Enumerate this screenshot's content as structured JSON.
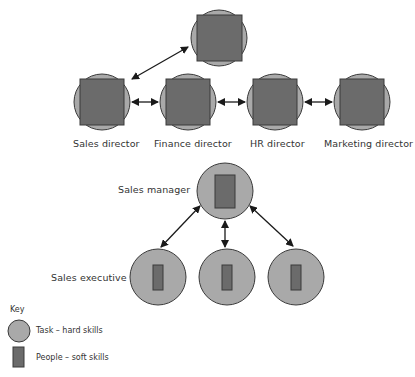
{
  "colors": {
    "circle_fill": "#a9a9a9",
    "square_fill": "#6b6b6b",
    "outline": "#3a3a3a",
    "arrow": "#1a1a1a",
    "background": "#ffffff"
  },
  "directors": {
    "top_node": {
      "label": ""
    },
    "items": [
      {
        "label": "Sales director"
      },
      {
        "label": "Finance director"
      },
      {
        "label": "HR director"
      },
      {
        "label": "Marketing director"
      }
    ]
  },
  "manager": {
    "label": "Sales manager"
  },
  "executives": {
    "label": "Sales executive",
    "count": 3
  },
  "key": {
    "title": "Key",
    "items": [
      {
        "icon": "circle-icon",
        "label": "Task – hard skills"
      },
      {
        "icon": "rectangle-icon",
        "label": "People – soft skills"
      }
    ]
  }
}
